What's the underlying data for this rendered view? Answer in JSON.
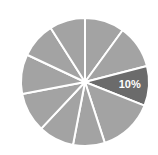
{
  "chart_data": {
    "type": "pie",
    "title": "",
    "subtitle": "",
    "xlabel": "",
    "ylabel": "",
    "grid": false,
    "legend_position": "none",
    "background_color": "#ffffff",
    "divider_color": "#ffffff",
    "divider_width": 2,
    "center": {
      "x": 85,
      "y": 82
    },
    "radius": 64,
    "start_angle_deg": -90,
    "direction": "clockwise",
    "default_slice_color": "#a3a3a3",
    "highlight_slice_color": "#6b6b6b",
    "label_color": "#ffffff",
    "categories": [
      "Slice 1",
      "Slice 2",
      "Slice 3",
      "Slice 4",
      "Slice 5",
      "Slice 6",
      "Slice 7",
      "Slice 8",
      "Slice 9",
      "Slice 10"
    ],
    "values": [
      10,
      11,
      10,
      14,
      8,
      9,
      10,
      10,
      9,
      9
    ],
    "labels": [
      "",
      "",
      "10%",
      "",
      "",
      "",
      "",
      "",
      "",
      ""
    ],
    "slices": [
      {
        "name": "Slice 1",
        "value": 10,
        "start_deg": -90,
        "end_deg": -54,
        "color": "#a3a3a3",
        "label": "",
        "highlighted": false
      },
      {
        "name": "Slice 2",
        "value": 11,
        "start_deg": -54,
        "end_deg": -14.4,
        "color": "#a3a3a3",
        "label": "",
        "highlighted": false
      },
      {
        "name": "Slice 3",
        "value": 10,
        "start_deg": -14.4,
        "end_deg": 21.6,
        "color": "#6b6b6b",
        "label": "10%",
        "highlighted": true
      },
      {
        "name": "Slice 4",
        "value": 14,
        "start_deg": 21.6,
        "end_deg": 72,
        "color": "#a3a3a3",
        "label": "",
        "highlighted": false
      },
      {
        "name": "Slice 5",
        "value": 8,
        "start_deg": 72,
        "end_deg": 100.8,
        "color": "#a3a3a3",
        "label": "",
        "highlighted": false
      },
      {
        "name": "Slice 6",
        "value": 9,
        "start_deg": 100.8,
        "end_deg": 133.2,
        "color": "#a3a3a3",
        "label": "",
        "highlighted": false
      },
      {
        "name": "Slice 7",
        "value": 10,
        "start_deg": 133.2,
        "end_deg": 169.2,
        "color": "#a3a3a3",
        "label": "",
        "highlighted": false
      },
      {
        "name": "Slice 8",
        "value": 10,
        "start_deg": 169.2,
        "end_deg": 205.2,
        "color": "#a3a3a3",
        "label": "",
        "highlighted": false
      },
      {
        "name": "Slice 9",
        "value": 9,
        "start_deg": 205.2,
        "end_deg": 237.6,
        "color": "#a3a3a3",
        "label": "",
        "highlighted": false
      },
      {
        "name": "Slice 10",
        "value": 9,
        "start_deg": 237.6,
        "end_deg": 270,
        "color": "#a3a3a3",
        "label": "",
        "highlighted": false
      }
    ]
  }
}
